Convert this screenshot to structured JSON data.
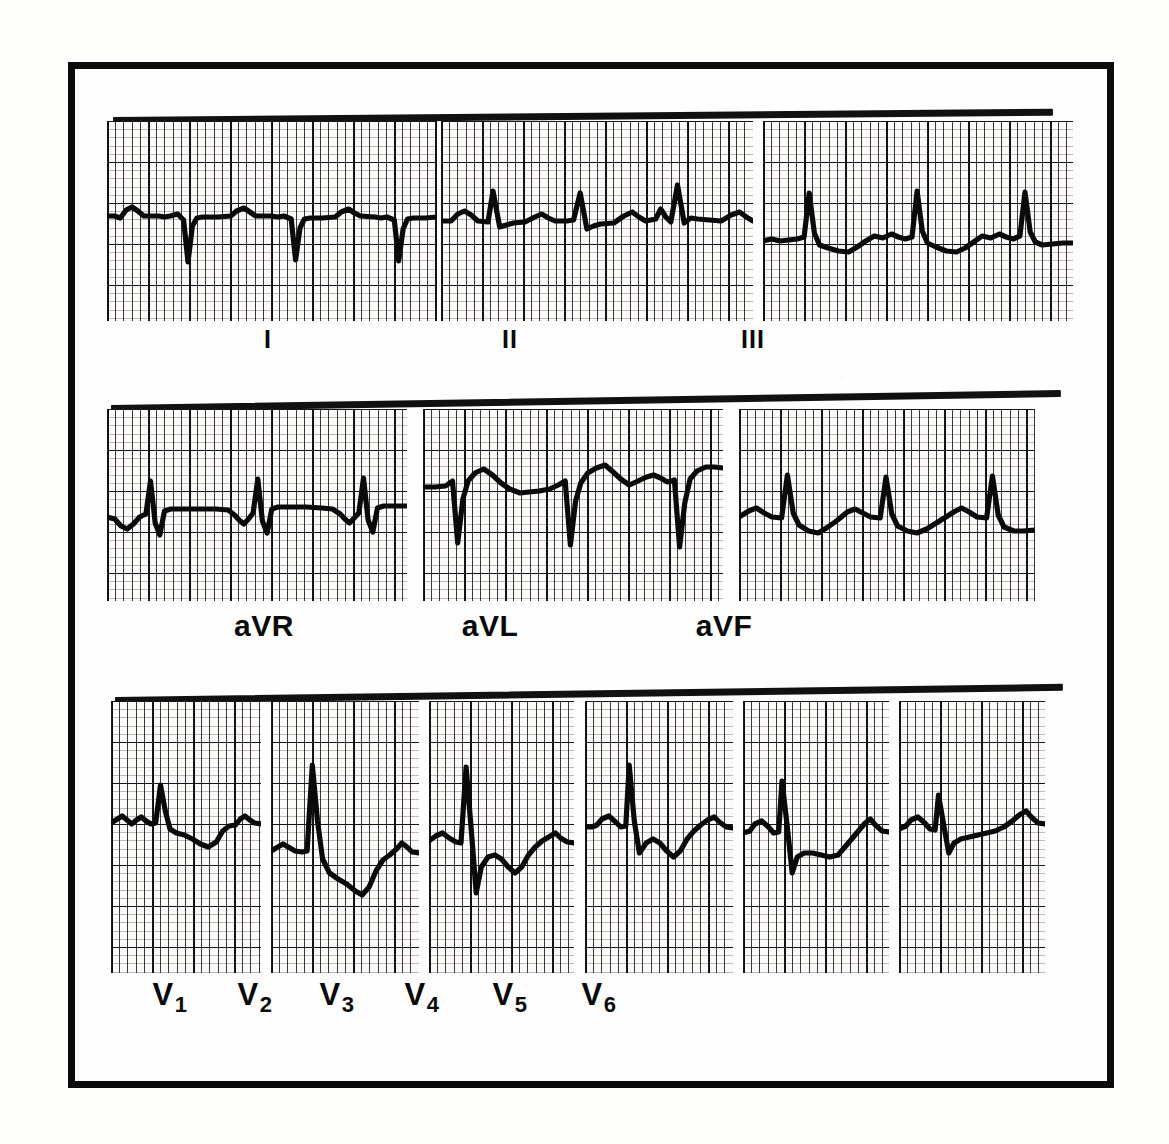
{
  "document": {
    "kind": "12-lead electrocardiogram",
    "frame": {
      "border_color": "#0b0b0b",
      "background": "#fefefe"
    },
    "paper": {
      "background": "#fbfaf8",
      "fine_grid_color": "#191919",
      "heavy_grid_color": "#000000",
      "trace_color": "#0a0a0a"
    }
  },
  "chart_data": {
    "type": "line",
    "xlabel": "Time",
    "ylabel": "Voltage",
    "grid": true,
    "legend": "none",
    "paper_speed_mm_per_s": 25,
    "gain_mm_per_mV": 10,
    "small_box_mm": 1,
    "large_box_mm": 5,
    "rows": [
      {
        "name": "limb-leads",
        "leads": [
          "I",
          "II",
          "III"
        ]
      },
      {
        "name": "augmented-leads",
        "leads": [
          "aVR",
          "aVL",
          "aVF"
        ]
      },
      {
        "name": "precordial-leads",
        "leads": [
          "V1",
          "V2",
          "V3",
          "V4",
          "V5",
          "V6"
        ]
      }
    ],
    "series": [
      {
        "name": "I",
        "label": "I",
        "row": 0,
        "beats": 3,
        "morphology": "small upright P, deep narrow S-predominant QRS, low flat T",
        "points": "0,0 10,0 18,2 26,-6 34,-9 42,-5 50,0 70,0 78,1 86,0 96,-2 104,4 110,46 116,10 122,2 130,1 150,1 168,0 176,-5 186,-8 194,-4 202,0 222,0 232,1 240,0 250,3 256,44 262,12 268,3 276,2 292,2 310,1 318,-4 328,-7 336,-3 344,0 364,1 372,2 380,1 390,4 396,45 402,13 408,3 416,2 432,2 448,1"
      },
      {
        "name": "II",
        "label": "II",
        "row": 0,
        "beats": 3,
        "morphology": "upright P, small r with tall narrow R, T wave low",
        "points": "0,0 12,0 20,-7 28,-10 36,-6 44,0 56,1 62,-30 70,6 78,4 86,2 100,1 112,-4 120,-7 128,-3 136,0 150,0 158,-1 166,-28 174,8 182,5 190,3 206,2 218,-5 228,-9 236,-4 244,0 256,-2 262,-12 268,-4 274,1 282,-36 290,2 298,-3 306,-2 320,-1 334,0 346,-6 356,-9 364,-4 372,0"
      },
      {
        "name": "III",
        "label": "III",
        "row": 0,
        "beats": 3,
        "morphology": "tall narrow R, small Q, shallow T inversion",
        "points": "0,2 10,0 20,2 30,1 40,0 48,-2 54,-46 60,-6 66,6 76,9 88,12 100,13 110,8 120,2 130,-3 140,-1 150,-5 158,-2 166,0 174,-2 180,-48 186,-8 192,4 202,8 214,12 226,13 236,9 246,3 256,-3 266,-1 276,-5 284,-2 292,0 300,-3 306,-47 312,-7 318,3 326,6 338,5 350,4 362,4"
      },
      {
        "name": "aVR",
        "label": "aVR",
        "row": 1,
        "beats": 3,
        "morphology": "negative P, small upward R with deep S, inverted T",
        "points": "0,0 10,2 18,9 26,12 34,7 42,0 50,-3 56,-36 62,6 68,18 74,-6 82,-8 96,-8 120,-8 140,-8 156,-7 164,-2 170,3 176,7 182,2 188,-4 194,-38 200,4 206,16 212,-8 220,-10 236,-10 256,-10 276,-9 290,-8 300,-3 306,2 312,6 318,1 324,-4 330,-39 336,3 342,15 348,-9 356,-11 370,-11 386,-11"
      },
      {
        "name": "aVL",
        "label": "aVL",
        "row": 1,
        "beats": 3,
        "morphology": "tiny r with very deep S, broad upright T",
        "points": "0,0 14,0 26,-1 34,-6 40,56 46,12 52,-6 60,-14 70,-18 80,-12 90,-4 100,2 112,6 122,5 134,4 146,2 156,-2 164,-6 170,58 176,14 182,-4 190,-14 200,-19 210,-22 218,-16 228,-8 238,-2 248,-6 258,-10 266,-12 274,-9 282,-5 290,-7 296,60 302,16 308,-8 316,-16 326,-20 336,-20 346,-19"
      },
      {
        "name": "aVF",
        "label": "aVF",
        "row": 1,
        "beats": 3,
        "morphology": "upright P, tall narrow R, small S then flat T",
        "points": "0,0 10,-6 18,-9 26,-4 34,0 44,1 50,-42 56,-4 62,8 72,14 82,16 92,10 102,3 112,-5 120,-8 128,-4 136,0 146,1 152,-40 158,-3 164,9 174,14 184,16 194,12 204,6 214,0 222,-5 230,-9 238,-5 246,0 256,1 262,-41 268,-2 274,10 284,14 294,14 306,13"
      },
      {
        "name": "V1",
        "label": "V1",
        "row": 2,
        "beats": 1,
        "morphology": "biphasic P, tall R, deep rounded T inversion",
        "points": "0,0 8,-4 14,-7 20,-3 26,1 32,-3 38,-6 44,-2 50,1 56,0 62,-38 68,-12 74,6 82,10 92,12 102,16 112,21 122,24 132,19 140,8 148,3 156,2 162,-4 168,-7 174,-3 180,0 188,1"
      },
      {
        "name": "V2",
        "label": "V2",
        "row": 2,
        "beats": 1,
        "morphology": "very tall narrow R, deep wide negative T",
        "points": "0,0 8,-4 14,-7 20,-4 28,0 36,1 42,0 48,-86 54,-30 60,8 68,22 78,28 88,33 98,40 106,44 114,36 122,20 130,9 138,4 146,-2 152,-8 158,-4 164,1 172,2"
      },
      {
        "name": "V3",
        "label": "V3",
        "row": 2,
        "beats": 1,
        "morphology": "tall R, deep S, broad inverted T",
        "points": "0,0 8,-5 16,-8 24,-3 32,1 38,2 44,-74 50,-12 56,52 62,26 70,16 78,14 86,18 94,26 102,32 110,26 118,14 126,6 134,0 142,-4 150,-8 156,-3 164,1 172,2"
      },
      {
        "name": "V4",
        "label": "V4",
        "row": 2,
        "beats": 1,
        "morphology": "rS then tall R, inverted T",
        "points": "0,0 8,0 14,-2 20,-8 28,-11 36,-5 42,0 48,-1 52,-62 58,-6 64,26 72,16 80,12 88,16 96,24 104,30 112,24 120,12 128,4 136,-2 144,-7 152,-10 158,-5 166,0 174,1"
      },
      {
        "name": "V5",
        "label": "V5",
        "row": 2,
        "beats": 1,
        "morphology": "small r, tall R with deep S, ST depression then upright T",
        "points": "0,0 8,-2 14,-9 22,-12 30,-6 36,0 42,-1 46,-52 52,-8 58,40 64,24 72,20 82,20 92,22 102,24 112,22 120,14 128,6 136,-2 144,-10 150,-14 156,-8 164,-2 172,-1"
      },
      {
        "name": "V6",
        "label": "V6",
        "row": 2,
        "beats": 1,
        "morphology": "small r, narrow qRs, gently rising upright T",
        "points": "0,0 8,-3 14,-9 22,-12 30,-6 36,0 42,1 46,-34 52,-4 58,24 64,14 72,10 82,8 92,6 102,4 112,2 122,-2 132,-8 140,-14 148,-18 154,-12 162,-6 170,-5"
      }
    ]
  },
  "labels": {
    "row1": [
      {
        "id": "lead-i",
        "text": "I"
      },
      {
        "id": "lead-ii",
        "text": "II"
      },
      {
        "id": "lead-iii",
        "text": "III"
      }
    ],
    "row2": [
      {
        "id": "lead-avr",
        "text": "aVR"
      },
      {
        "id": "lead-avl",
        "text": "aVL"
      },
      {
        "id": "lead-avf",
        "text": "aVF"
      }
    ],
    "row3": [
      {
        "id": "lead-v1",
        "base": "V",
        "sub": "1"
      },
      {
        "id": "lead-v2",
        "base": "V",
        "sub": "2"
      },
      {
        "id": "lead-v3",
        "base": "V",
        "sub": "3"
      },
      {
        "id": "lead-v4",
        "base": "V",
        "sub": "4"
      },
      {
        "id": "lead-v5",
        "base": "V",
        "sub": "5"
      },
      {
        "id": "lead-v6",
        "base": "V",
        "sub": "6"
      }
    ]
  },
  "layout": {
    "rows": [
      {
        "name": "limb-leads",
        "top": 52,
        "height": 200,
        "label_top": 256,
        "topbar": {
          "left": 38,
          "width": 940,
          "skew": -0.5
        },
        "strips": [
          {
            "lead": "I",
            "left": 32,
            "width": 330,
            "baseline": 95,
            "label_x": 193,
            "scale": 1.0
          },
          {
            "lead": "II",
            "left": 366,
            "width": 312,
            "baseline": 100,
            "label_x": 435,
            "scale": 1.0
          },
          {
            "lead": "III",
            "left": 688,
            "width": 310,
            "baseline": 118,
            "label_x": 678,
            "scale": 1.0
          }
        ]
      },
      {
        "name": "augmented-leads",
        "top": 340,
        "height": 192,
        "label_top": 540,
        "topbar": {
          "left": 36,
          "width": 950,
          "skew": -0.9
        },
        "strips": [
          {
            "lead": "aVR",
            "left": 32,
            "width": 300,
            "baseline": 108,
            "label_x": 189,
            "scale": 1.0
          },
          {
            "lead": "aVL",
            "left": 348,
            "width": 300,
            "baseline": 78,
            "label_x": 415,
            "scale": 1.0
          },
          {
            "lead": "aVF",
            "left": 664,
            "width": 296,
            "baseline": 108,
            "label_x": 649,
            "scale": 1.0
          }
        ]
      },
      {
        "name": "precordial-leads",
        "top": 632,
        "height": 272,
        "label_top": 908,
        "topbar": {
          "left": 40,
          "width": 948,
          "skew": -0.8
        },
        "strips": [
          {
            "lead": "V1",
            "left": 36,
            "width": 150,
            "baseline": 122,
            "label_x": 95,
            "scale": 1.0
          },
          {
            "lead": "V2",
            "left": 196,
            "width": 148,
            "baseline": 150,
            "label_x": 180,
            "scale": 1.0
          },
          {
            "lead": "V3",
            "left": 354,
            "width": 145,
            "baseline": 140,
            "label_x": 262,
            "scale": 1.0
          },
          {
            "lead": "V4",
            "left": 510,
            "width": 148,
            "baseline": 126,
            "label_x": 347,
            "scale": 1.0
          },
          {
            "lead": "V5",
            "left": 668,
            "width": 146,
            "baseline": 132,
            "label_x": 435,
            "scale": 1.0
          },
          {
            "lead": "V6",
            "left": 824,
            "width": 146,
            "baseline": 128,
            "label_x": 524,
            "scale": 1.0
          }
        ]
      }
    ]
  }
}
